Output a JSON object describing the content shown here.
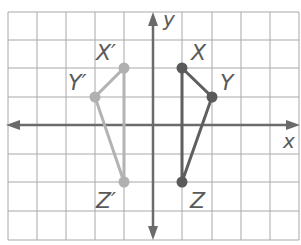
{
  "diagram": {
    "type": "coordinate-plane-reflection",
    "grid": {
      "x_min": -5,
      "x_max": 5,
      "y_min": -4,
      "y_max": 4
    },
    "axes": {
      "x_label": "x",
      "y_label": "y"
    },
    "colors": {
      "grid": "#9a9a9a",
      "axis": "#6b6b6b",
      "original": "#606060",
      "image": "#b0b0b0",
      "label": "#5a5a5a"
    },
    "original": {
      "points": [
        {
          "name": "X",
          "x": 1,
          "y": 2
        },
        {
          "name": "Y",
          "x": 2,
          "y": 1
        },
        {
          "name": "Z",
          "x": 1,
          "y": -2
        }
      ]
    },
    "image": {
      "points": [
        {
          "name": "X′",
          "x": -1,
          "y": 2
        },
        {
          "name": "Y′",
          "x": -2,
          "y": 1
        },
        {
          "name": "Z′",
          "x": -1,
          "y": -2
        }
      ]
    }
  }
}
